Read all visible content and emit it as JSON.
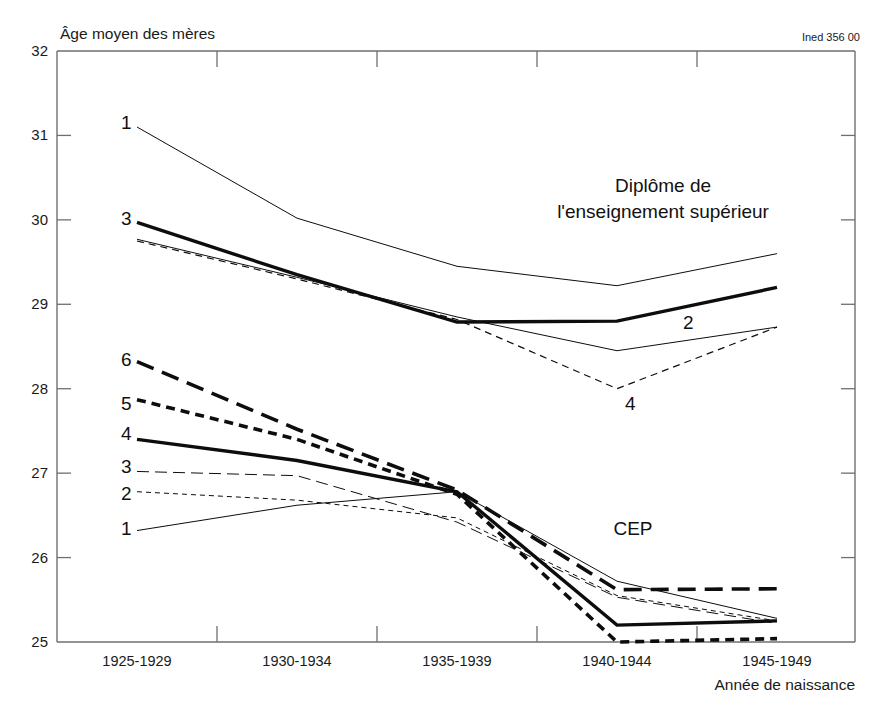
{
  "figure": {
    "credit": "Ined 356 00",
    "y_axis_title": "Âge moyen des mères",
    "x_axis_title": "Année de naissance"
  },
  "chart_data": {
    "type": "line",
    "title": "Âge moyen des mères",
    "xlabel": "Année de naissance",
    "ylabel": "Âge moyen des mères",
    "ylim": [
      25,
      32
    ],
    "yticks": [
      25,
      26,
      27,
      28,
      29,
      30,
      31,
      32
    ],
    "ytick_labels": [
      "25",
      "26",
      "27",
      "28",
      "29",
      "30",
      "31",
      "32"
    ],
    "grid": false,
    "legend": "inline-labels",
    "categories": [
      "1925-1929",
      "1930-1934",
      "1935-1939",
      "1940-1944",
      "1945-1949"
    ],
    "annotations": [
      {
        "text": "Diplôme de",
        "x_px": 663,
        "y_px": 192
      },
      {
        "text": "l'enseignement supérieur",
        "x_px": 663,
        "y_px": 218
      },
      {
        "text": "CEP",
        "x_px": 633,
        "y_px": 535
      }
    ],
    "groups": [
      {
        "name": "Diplôme de l'enseignement supérieur",
        "series": [
          {
            "id": "1",
            "label": "1",
            "style": "thin-solid",
            "stroke_width": 1.0,
            "dash": "none",
            "label_px": {
              "x": 121,
              "y": 129
            },
            "values": [
              31.1,
              30.02,
              29.45,
              29.22,
              29.6
            ]
          },
          {
            "id": "2",
            "label": "2",
            "style": "thin-solid",
            "stroke_width": 1.0,
            "dash": "none",
            "label_px": {
              "x": 683,
              "y": 329
            },
            "values": [
              29.77,
              29.32,
              28.85,
              28.45,
              28.73
            ]
          },
          {
            "id": "3",
            "label": "3",
            "style": "thick-solid",
            "stroke_width": 3.4,
            "dash": "none",
            "label_px": {
              "x": 121,
              "y": 225
            },
            "values": [
              29.97,
              29.35,
              28.79,
              28.8,
              29.2
            ]
          },
          {
            "id": "4",
            "label": "4",
            "style": "thin-dashed",
            "stroke_width": 1.2,
            "dash": "7,5",
            "label_px": {
              "x": 625,
              "y": 410
            },
            "values": [
              29.75,
              29.3,
              28.82,
              28.0,
              28.73
            ]
          }
        ]
      },
      {
        "name": "CEP",
        "series": [
          {
            "id": "1",
            "label": "1",
            "style": "thin-solid",
            "stroke_width": 1.0,
            "dash": "none",
            "label_px": {
              "x": 121,
              "y": 535
            },
            "values": [
              26.32,
              26.62,
              26.78,
              25.72,
              25.28
            ]
          },
          {
            "id": "2",
            "label": "2",
            "style": "thin-short-dash",
            "stroke_width": 1.0,
            "dash": "5,4",
            "label_px": {
              "x": 121,
              "y": 500
            },
            "values": [
              26.78,
              26.68,
              26.47,
              25.55,
              25.25
            ]
          },
          {
            "id": "3",
            "label": "3",
            "style": "thin-long-dash",
            "stroke_width": 1.0,
            "dash": "12,6",
            "label_px": {
              "x": 121,
              "y": 473
            },
            "values": [
              27.02,
              26.97,
              26.42,
              25.53,
              25.22
            ]
          },
          {
            "id": "4",
            "label": "4",
            "style": "thick-solid",
            "stroke_width": 3.4,
            "dash": "none",
            "label_px": {
              "x": 121,
              "y": 440
            },
            "values": [
              27.4,
              27.15,
              26.78,
              25.2,
              25.25
            ]
          },
          {
            "id": "5",
            "label": "5",
            "style": "thick-short-dash",
            "stroke_width": 3.6,
            "dash": "9,6",
            "label_px": {
              "x": 121,
              "y": 410
            },
            "values": [
              27.87,
              27.4,
              26.75,
              25.0,
              25.04
            ]
          },
          {
            "id": "6",
            "label": "6",
            "style": "thick-long-dash",
            "stroke_width": 3.6,
            "dash": "18,9",
            "label_px": {
              "x": 121,
              "y": 366
            },
            "values": [
              28.32,
              27.52,
              26.8,
              25.62,
              25.63
            ]
          }
        ]
      }
    ]
  }
}
